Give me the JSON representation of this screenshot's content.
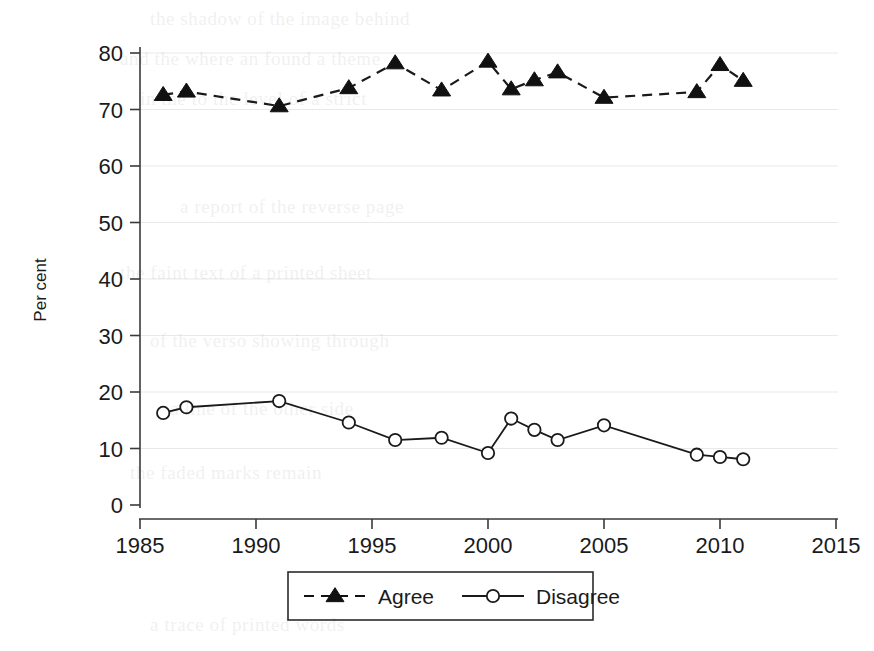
{
  "figure": {
    "title": "",
    "background_color": "#ffffff",
    "ink_color": "#1a1a1a"
  },
  "axes": {
    "y_title": "Per cent",
    "y_ticks": [
      "0",
      "10",
      "20",
      "30",
      "40",
      "50",
      "60",
      "70",
      "80"
    ],
    "x_ticks": [
      "1985",
      "1990",
      "1995",
      "2000",
      "2005",
      "2010",
      "2015"
    ]
  },
  "legend": {
    "items": [
      {
        "label": "Agree",
        "marker": "filled-triangle",
        "line": "dashed",
        "color": "#111111"
      },
      {
        "label": "Disagree",
        "marker": "open-circle",
        "line": "solid",
        "color": "#1a1a1a"
      }
    ]
  },
  "scan_bleed": [
    {
      "text": "the shadow of the image behind",
      "x": 150,
      "y": 8,
      "size": 19
    },
    {
      "text": "and the where an found a theme",
      "x": 120,
      "y": 48,
      "size": 19
    },
    {
      "text": "in the to the level of a strict",
      "x": 140,
      "y": 88,
      "size": 19
    },
    {
      "text": "a report of the reverse page",
      "x": 180,
      "y": 196,
      "size": 19
    },
    {
      "text": "the faint text of a printed sheet",
      "x": 120,
      "y": 262,
      "size": 19
    },
    {
      "text": "of the verso showing through",
      "x": 150,
      "y": 330,
      "size": 19
    },
    {
      "text": "a line of the other side",
      "x": 170,
      "y": 398,
      "size": 19
    },
    {
      "text": "the faded marks remain",
      "x": 130,
      "y": 462,
      "size": 19
    },
    {
      "text": "a trace of printed words",
      "x": 150,
      "y": 614,
      "size": 19
    }
  ],
  "chart_data": {
    "type": "line",
    "title": "",
    "xlabel": "",
    "ylabel": "Per cent",
    "xlim": [
      1985,
      2015
    ],
    "ylim": [
      0,
      80
    ],
    "grid": "horizontal",
    "legend_position": "bottom-center",
    "series": [
      {
        "name": "Agree",
        "marker": "filled-triangle",
        "line_style": "dashed",
        "x": [
          1986,
          1987,
          1991,
          1994,
          1996,
          1998,
          2000,
          2001,
          2002,
          2003,
          2005,
          2009,
          2010,
          2011
        ],
        "values": [
          72.6,
          73.2,
          70.6,
          73.8,
          78.2,
          73.4,
          78.5,
          73.6,
          75.2,
          76.6,
          72.1,
          73.1,
          77.9,
          75.1
        ]
      },
      {
        "name": "Disagree",
        "marker": "open-circle",
        "line_style": "solid",
        "x": [
          1986,
          1987,
          1991,
          1994,
          1996,
          1998,
          2000,
          2001,
          2002,
          2003,
          2005,
          2009,
          2010,
          2011
        ],
        "values": [
          16.3,
          17.3,
          18.4,
          14.6,
          11.5,
          11.9,
          9.2,
          15.3,
          13.3,
          11.5,
          14.1,
          8.9,
          8.5,
          8.1
        ]
      }
    ]
  }
}
